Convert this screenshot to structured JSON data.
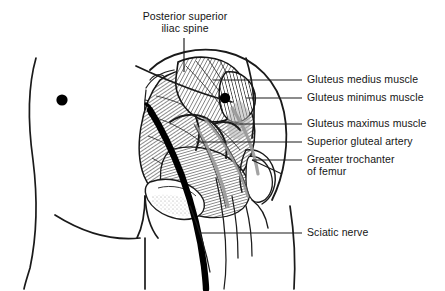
{
  "figure": {
    "width": 445,
    "height": 291,
    "background_color": "#ffffff",
    "ink_color": "#151515",
    "line_color": "#1a1a1a",
    "nerve_color": "#000000",
    "hatch_gray": "#6f6f6f",
    "shadow_gray": "#b9b9b9"
  },
  "labels": {
    "psis": "Posterior superior\niliac spine",
    "gluteus_medius": "Gluteus medius muscle",
    "gluteus_minimus": "Gluteus minimus muscle",
    "gluteus_maximus": "Gluteus maximus muscle",
    "superior_gluteal_artery": "Superior gluteal artery",
    "greater_trochanter": "Greater trochanter\nof femur",
    "sciatic_nerve": "Sciatic nerve"
  },
  "structures": [
    {
      "name": "posterior-superior-iliac-spine",
      "label_key": "psis",
      "leader": "vertical-from-top"
    },
    {
      "name": "gluteus-medius-muscle",
      "label_key": "gluteus_medius",
      "leader": "horizontal-right"
    },
    {
      "name": "gluteus-minimus-muscle",
      "label_key": "gluteus_minimus",
      "leader": "horizontal-right"
    },
    {
      "name": "gluteus-maximus-muscle",
      "label_key": "gluteus_maximus",
      "leader": "horizontal-right"
    },
    {
      "name": "superior-gluteal-artery",
      "label_key": "superior_gluteal_artery",
      "leader": "horizontal-right"
    },
    {
      "name": "greater-trochanter-of-femur",
      "label_key": "greater_trochanter",
      "leader": "horizontal-right-tick"
    },
    {
      "name": "sciatic-nerve",
      "label_key": "sciatic_nerve",
      "leader": "horizontal-right"
    }
  ],
  "markers": {
    "injection_landmark_dot": {
      "cx": 62,
      "cy": 100,
      "r": 5.6,
      "color": "#000000"
    }
  }
}
